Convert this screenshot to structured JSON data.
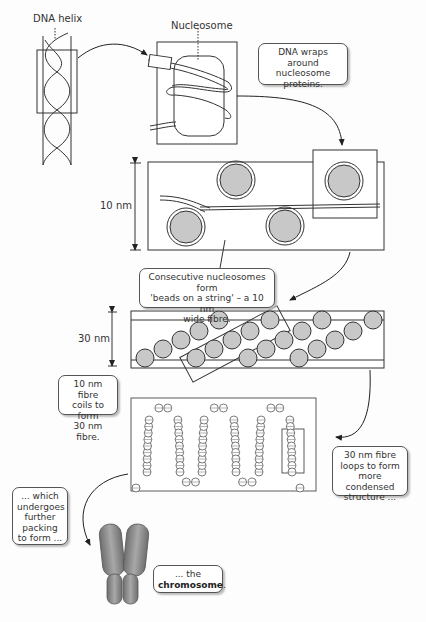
{
  "labels": {
    "dna_helix": "DNA helix",
    "nucleosome": "Nucleosome",
    "ten_nm": "10 nm",
    "thirty_nm": "30 nm"
  },
  "callouts": {
    "wraps": "DNA wraps around nucleosome proteins.",
    "beads_line1": "Consecutive nucleosomes form",
    "beads_line2": "'beads on a string' – a 10 nm",
    "beads_line3": "wide fibre.",
    "coils_line1": "10 nm fibre",
    "coils_line2": "coils to form",
    "coils_line3": "30 nm fibre.",
    "loops_line1": "30 nm fibre",
    "loops_line2": "loops to form",
    "loops_line3": "more condensed",
    "loops_line4": "structure ...",
    "packing_line1": "... which",
    "packing_line2": "undergoes",
    "packing_line3": "further",
    "packing_line4": "packing",
    "packing_line5": "to form ...",
    "chromosome_prefix": "... the",
    "chromosome_word": "chromosome",
    "chromosome_suffix": "."
  },
  "colors": {
    "line": "#333333",
    "bead_fill": "#c9c9c9",
    "chromosome_fill": "#8a8a8a"
  }
}
